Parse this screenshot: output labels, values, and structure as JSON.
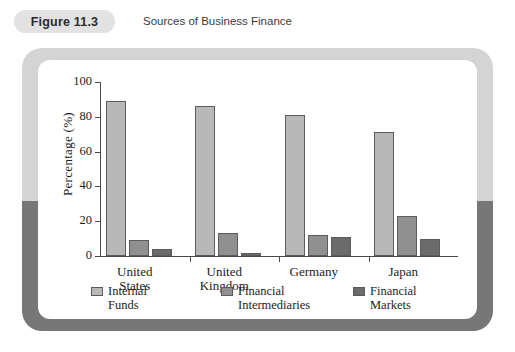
{
  "header": {
    "badge_label": "Figure 11.3",
    "caption": "Sources of Business Finance"
  },
  "colors": {
    "internal_funds": "#b8b8b8",
    "financial_intermediaries": "#909090",
    "financial_markets": "#6b6b6b",
    "frame_top": "#d4d4d4",
    "frame_bottom": "#777777",
    "badge_bg": "#e2e2e2",
    "axis": "#4a4a4a"
  },
  "chart_data": {
    "type": "bar",
    "title": "Sources of Business Finance",
    "xlabel": "",
    "ylabel": "Percentage (%)",
    "ylim": [
      0,
      100
    ],
    "yticks": [
      0,
      20,
      40,
      60,
      80,
      100
    ],
    "grid": false,
    "legend_position": "bottom",
    "categories": [
      "United States",
      "United Kingdom",
      "Germany",
      "Japan"
    ],
    "series": [
      {
        "name": "Internal Funds",
        "values": [
          89,
          86,
          81,
          71
        ]
      },
      {
        "name": "Financial Intermediaries",
        "values": [
          9,
          13,
          12,
          23
        ]
      },
      {
        "name": "Financial Markets",
        "values": [
          4,
          2,
          11,
          10
        ]
      }
    ]
  }
}
